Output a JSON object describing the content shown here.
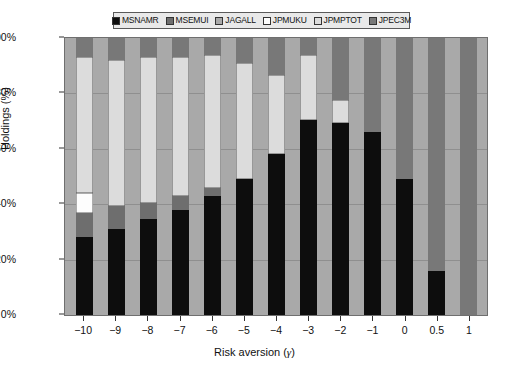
{
  "chart_data": {
    "type": "bar",
    "stacked": true,
    "stacked_mode": "percent",
    "title": "",
    "xlabel": "Risk aversion (γ)",
    "ylabel": "Holdings (%)",
    "categories": [
      "−10",
      "−9",
      "−8",
      "−7",
      "−6",
      "−5",
      "−4",
      "−3",
      "−2",
      "−1",
      "0",
      "0.5",
      "1"
    ],
    "ylim": [
      0,
      100
    ],
    "yticks": [
      0,
      20,
      40,
      60,
      80,
      100
    ],
    "ytick_labels": [
      "0%",
      "20%",
      "40%",
      "60%",
      "80%",
      "100%"
    ],
    "grid": true,
    "legend_position": "top",
    "series": [
      {
        "name": "MSNAMR",
        "color": "#0d0d0d",
        "values": [
          28,
          31,
          34.5,
          38,
          43,
          49,
          58,
          70.5,
          69.5,
          66,
          49,
          16,
          0
        ]
      },
      {
        "name": "MSEMUI",
        "color": "#6e6e6e",
        "values": [
          9,
          8.5,
          6,
          5,
          3,
          0,
          0,
          0,
          0,
          0,
          0,
          0,
          0
        ]
      },
      {
        "name": "JAGALL",
        "color": "#a9a9a9",
        "values": [
          0,
          0,
          0,
          0,
          0,
          0,
          0,
          0,
          0,
          0,
          0,
          0,
          0
        ]
      },
      {
        "name": "JPMUKU",
        "color": "#fdfdfd",
        "values": [
          7,
          0,
          0,
          0,
          0,
          0,
          0,
          0,
          0,
          0,
          0,
          0,
          0
        ]
      },
      {
        "name": "JPMPTOT",
        "color": "#dcdcdc",
        "values": [
          49,
          52.5,
          52.5,
          50,
          48,
          42,
          28.5,
          23.5,
          8,
          0,
          0,
          0,
          0
        ]
      },
      {
        "name": "JPEC3M",
        "color": "#787878",
        "values": [
          7,
          8,
          7,
          7,
          6,
          9,
          13.5,
          6,
          22.5,
          34,
          51,
          84,
          100
        ]
      }
    ]
  },
  "legend": {
    "items": [
      {
        "label": "MSNAMR",
        "color": "#0d0d0d"
      },
      {
        "label": "MSEMUI",
        "color": "#6e6e6e"
      },
      {
        "label": "JAGALL",
        "color": "#a9a9a9"
      },
      {
        "label": "JPMUKU",
        "color": "#fdfdfd"
      },
      {
        "label": "JPMPTOT",
        "color": "#dcdcdc"
      },
      {
        "label": "JPEC3M",
        "color": "#787878"
      }
    ]
  },
  "axes": {
    "y_label": "Holdings (%)",
    "x_label_prefix": "Risk aversion (",
    "x_label_symbol": "γ",
    "x_label_suffix": ")"
  },
  "style": {
    "plot_background": "#a9a9a9",
    "gridline_color": "#8f8f8f",
    "frame_color": "#6f6f6f",
    "legend_background": "#e9e9e9"
  }
}
